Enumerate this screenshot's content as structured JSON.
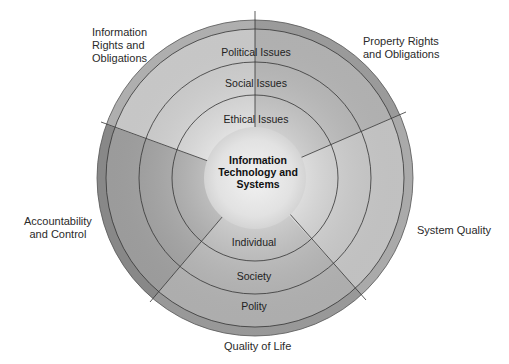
{
  "diagram": {
    "center": {
      "line1": "Information",
      "line2": "Technology and",
      "line3": "Systems"
    },
    "rings": {
      "upper": [
        "Ethical Issues",
        "Social Issues",
        "Political Issues"
      ],
      "lower": [
        "Individual",
        "Society",
        "Polity"
      ]
    },
    "ring_labels": {
      "ethical": "Ethical Issues",
      "social": "Social Issues",
      "political": "Political Issues",
      "individual": "Individual",
      "society": "Society",
      "polity": "Polity"
    },
    "dimensions": {
      "info_rights_1": "Information",
      "info_rights_2": "Rights and",
      "info_rights_3": "Obligations",
      "property_1": "Property Rights",
      "property_2": "and Obligations",
      "system_quality": "System Quality",
      "quality_of_life": "Quality of Life",
      "accountability_1": "Accountability",
      "accountability_2": "and Control"
    },
    "colors": {
      "segment_light": "#d9d9d9",
      "segment_medium": "#bdbdbd",
      "segment_dark": "#a9a9a9",
      "outer_band": "#a0a0a0",
      "line": "#333333",
      "center": "#e6e6e6"
    }
  }
}
